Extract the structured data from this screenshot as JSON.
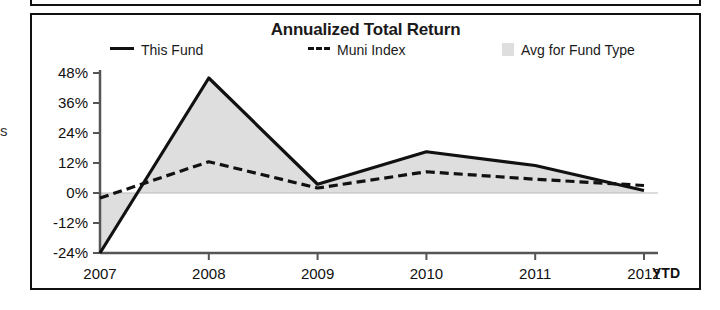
{
  "chart": {
    "title": "Annualized Total Return",
    "legend": [
      {
        "label": "This Fund",
        "marker": "solid-line",
        "color": "#111111"
      },
      {
        "label": "Muni Index",
        "marker": "dashed-line",
        "color": "#111111"
      },
      {
        "label": "Avg for Fund Type",
        "marker": "area-swatch",
        "color": "#dedede"
      }
    ],
    "x_axis_note": "YTD"
  },
  "chart_data": {
    "type": "line",
    "title": "Annualized Total Return",
    "xlabel": "",
    "ylabel": "",
    "categories": [
      "2007",
      "2008",
      "2009",
      "2010",
      "2011",
      "2012"
    ],
    "x_tick_labels": [
      "2007",
      "2008",
      "2009",
      "2010",
      "2011",
      "2012"
    ],
    "x_axis_note": "YTD",
    "y_tick_labels": [
      "48%",
      "36%",
      "24%",
      "12%",
      "0%",
      "-12%",
      "-24%"
    ],
    "y_ticks": [
      48,
      36,
      24,
      12,
      0,
      -12,
      -24
    ],
    "ylim": [
      -24,
      48
    ],
    "grid": false,
    "legend_position": "top",
    "series": [
      {
        "name": "This Fund",
        "style": "solid",
        "color": "#111111",
        "values": [
          -24,
          46,
          3.5,
          16.5,
          11,
          1
        ]
      },
      {
        "name": "Muni Index",
        "style": "dashed",
        "color": "#111111",
        "values": [
          -2,
          12.5,
          2,
          8.5,
          5.5,
          3
        ]
      },
      {
        "name": "Avg for Fund Type",
        "style": "filled-area",
        "color": "#dedede",
        "values": [
          -24,
          46,
          3.5,
          17,
          11,
          1
        ]
      }
    ]
  }
}
